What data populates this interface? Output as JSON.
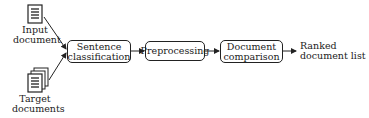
{
  "diagram": {
    "inputs": [
      {
        "label_line1": "Input",
        "label_line2": "document",
        "icon": "single-document-icon"
      },
      {
        "label_line1": "Target",
        "label_line2": "documents",
        "icon": "document-stack-icon"
      }
    ],
    "steps": [
      {
        "line1": "Sentence",
        "line2": "classification"
      },
      {
        "line1": "Preprocessing",
        "line2": ""
      },
      {
        "line1": "Document",
        "line2": "comparison"
      }
    ],
    "output": {
      "line1": "Ranked",
      "line2": "document list"
    },
    "colors": {
      "stroke": "#222222",
      "background": "#ffffff"
    }
  }
}
